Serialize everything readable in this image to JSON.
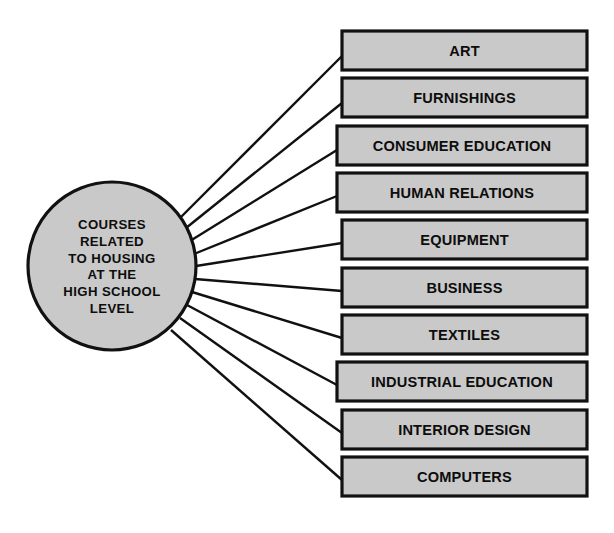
{
  "diagram": {
    "type": "spider-hub-and-spoke",
    "colors": {
      "node_fill": "#c9c9c9",
      "node_stroke": "#111111",
      "connector": "#111111",
      "text": "#0d0d0d",
      "background": "#ffffff"
    },
    "hub": {
      "shape": "circle",
      "center_x": 112,
      "center_y": 266,
      "radius": 84,
      "lines": [
        "COURSES",
        "RELATED",
        "TO HOUSING",
        "AT THE",
        "HIGH SCHOOL",
        "LEVEL"
      ]
    },
    "nodes": [
      {
        "label": "ART",
        "x": 342,
        "y": 31,
        "width": 245,
        "height": 39
      },
      {
        "label": "FURNISHINGS",
        "x": 342,
        "y": 78,
        "width": 245,
        "height": 39
      },
      {
        "label": "CONSUMER EDUCATION",
        "x": 337,
        "y": 126,
        "width": 250,
        "height": 39
      },
      {
        "label": "HUMAN RELATIONS",
        "x": 337,
        "y": 173,
        "width": 250,
        "height": 39
      },
      {
        "label": "EQUIPMENT",
        "x": 342,
        "y": 220,
        "width": 245,
        "height": 39
      },
      {
        "label": "BUSINESS",
        "x": 342,
        "y": 268,
        "width": 245,
        "height": 39
      },
      {
        "label": "TEXTILES",
        "x": 342,
        "y": 315,
        "width": 245,
        "height": 39
      },
      {
        "label": "INDUSTRIAL EDUCATION",
        "x": 337,
        "y": 362,
        "width": 250,
        "height": 39
      },
      {
        "label": "INTERIOR DESIGN",
        "x": 342,
        "y": 410,
        "width": 245,
        "height": 39
      },
      {
        "label": "COMPUTERS",
        "x": 342,
        "y": 457,
        "width": 245,
        "height": 39
      }
    ],
    "connectors": [
      {
        "from_node": "hub",
        "to_node": "ART",
        "x1": 181,
        "y1": 217,
        "x2": 342,
        "y2": 56
      },
      {
        "from_node": "hub",
        "to_node": "FURNISHINGS",
        "x1": 186,
        "y1": 228,
        "x2": 342,
        "y2": 103
      },
      {
        "from_node": "hub",
        "to_node": "CONSUMER EDUCATION",
        "x1": 190,
        "y1": 241,
        "x2": 337,
        "y2": 150
      },
      {
        "from_node": "hub",
        "to_node": "HUMAN RELATIONS",
        "x1": 194,
        "y1": 254,
        "x2": 337,
        "y2": 196
      },
      {
        "from_node": "hub",
        "to_node": "EQUIPMENT",
        "x1": 196,
        "y1": 266,
        "x2": 342,
        "y2": 243
      },
      {
        "from_node": "hub",
        "to_node": "BUSINESS",
        "x1": 195,
        "y1": 279,
        "x2": 342,
        "y2": 291
      },
      {
        "from_node": "hub",
        "to_node": "TEXTILES",
        "x1": 192,
        "y1": 292,
        "x2": 342,
        "y2": 338
      },
      {
        "from_node": "hub",
        "to_node": "INDUSTRIAL EDUCATION",
        "x1": 187,
        "y1": 305,
        "x2": 337,
        "y2": 385
      },
      {
        "from_node": "hub",
        "to_node": "INTERIOR DESIGN",
        "x1": 180,
        "y1": 318,
        "x2": 342,
        "y2": 433
      },
      {
        "from_node": "hub",
        "to_node": "COMPUTERS",
        "x1": 171,
        "y1": 330,
        "x2": 342,
        "y2": 480
      }
    ]
  }
}
